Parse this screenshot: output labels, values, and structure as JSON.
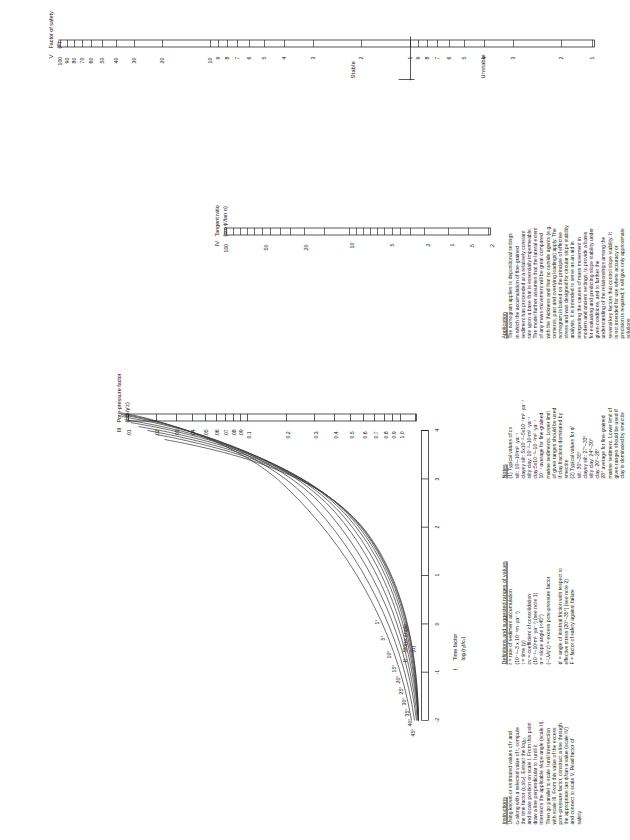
{
  "figure": {
    "title_hidden": "",
    "scales": [
      {
        "roman": "I",
        "name": "Time factor",
        "sub": "log (r₀t/cᵥ)",
        "ticks": [
          "-2",
          "-1",
          "0",
          "1",
          "2",
          "3",
          "4"
        ],
        "range": [
          -2,
          4
        ]
      },
      {
        "roman": "II",
        "name": "Slope angle",
        "sub": "(α)",
        "curve_labels": [
          "45°",
          "40°",
          "35°",
          "30°",
          "25°",
          "20°",
          "15°",
          "10°",
          "5°",
          "1°"
        ]
      },
      {
        "roman": "III",
        "name": "Pore-pressure factor",
        "sub": "(−Uᵥ/γ′z)",
        "ticks": [
          ".01",
          ".02",
          ".03",
          ".04",
          ".05",
          ".06",
          ".07",
          ".08",
          ".09",
          "0.1",
          "0.2",
          "0.3",
          "0.4",
          "0.5",
          "0.6",
          "0.7",
          "0.8",
          "0.9",
          "1.0"
        ]
      },
      {
        "roman": "IV",
        "name": "Tangent ratio",
        "sub": "(tan ϕ′/tan α)",
        "ticks": [
          "100",
          "50",
          "20",
          "10",
          "5",
          "2",
          "1",
          ".5",
          ".2"
        ]
      },
      {
        "roman": "V",
        "name": "Factor of safety",
        "sub": "(F)",
        "ticks": [
          "100",
          "90",
          "80",
          "70",
          "60",
          "50",
          "40",
          "30",
          "20",
          "10",
          "9",
          "8",
          "7",
          "6",
          "5",
          "4",
          "3",
          "2",
          "1",
          "9",
          "8",
          "7",
          "6",
          "5",
          "4",
          "3",
          "2",
          "1"
        ],
        "zone_stable": "Stable",
        "zone_unstable": "Unstable"
      }
    ]
  },
  "instructions": {
    "heading": "Instructions",
    "body": "Using known or estimated values of r and\ncᵥ along with a selected value of t, compute\nthe time factor (r₀t/cᵥ). Extract the log₁₀\nand locate position on scale I. From this point\ndraw a line perpendicular to I until it\nintersects the applicable slope angle (scale II).\nThen go parallel to scale I until intersection\nwith scale III. From this value of the excess\npore-pressure factor, construct a line through\nthe appropriate tan ϕ′/tan α value (scale IV)\nand connect to scale V. Read factor of\nsafety"
  },
  "definitions": {
    "heading": "Definitions and suggested ranges of values",
    "lines": [
      "r = rate of sediment accumulation",
      "(10⁻⁴–3 x 10⁻¹m ·ya⁻¹)",
      "t = time (y)",
      "cv = coefficient of consolidation",
      "(10⁻²–10¹m² ·ya⁻¹) (see note 1)",
      "α = slope angle (<45°)",
      "(−Uᵥ/γ′z) = excess pore-pressure factor",
      "",
      "ϕ′ = angle of internal friction with respect to",
      "effective stress (20°–35°) (see note 2)",
      "F = factor of safety against failure"
    ]
  },
  "notes": {
    "heading": "Notes",
    "lines": [
      "(1) Typical values of cv",
      "silt: 10¹–10²m² ·ya⁻¹",
      "clayey silt: 5x10⁻²–5x10⁻¹m² ·ya⁻¹",
      "silty clay: 10⁻²–10¹m² ·ya⁻¹",
      "clay:5x10⁻³–10⁻²m² ·ya⁻¹",
      "10⁻¹ average for fine-grained",
      "marine sediments. Lower limit",
      "of given ranges should be used",
      "if clay fractions dominated by",
      "smectite",
      "(2) Typical values for ϕ′",
      "silt: 30°–35°",
      "clayey silt: 27°–33°",
      "silty clay: 24°–30°",
      "clay: 20°–28°",
      "28° average for fine-grained",
      "marine sediment. Lower limit of",
      "given ranges should be used if",
      "clay is dominated by smectite"
    ]
  },
  "application": {
    "heading": "Application",
    "body": "The nomogram applies to depositional settings\nin which the accumulation of fine-grained\nsediment has proceeded at a relatively constant\nrate upon a base that is essentially impermeable.\nThe model further assumes that the lateral extent\nof any mass movement will be great compared\nwith the thickness and that no outside agents (e.g.\ncements, past and overlying loadings) apply. The\nnomogram is based on the principle of effective\nstress and was designed for circular slope stability\nanalysis. It is intended to serve as an aid in\ninterpreting the causes of mass movement in\nmodern and ancient settings, to provide a basis\nfor evaluating and predicting slope stability under\ngiven conditions, and to further the\nunderstanding of the relationships among the\nseveral key factors that control slope stability. It\nis not intended for use where accuracy or\nprecision is required; it will give only approximate\nsolutions"
  },
  "colors": {
    "ink": "#111111",
    "paper": "#ffffff",
    "curve": "#333333"
  }
}
